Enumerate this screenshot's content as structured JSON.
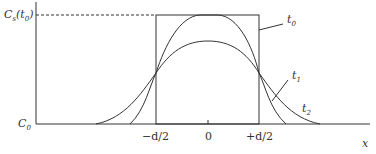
{
  "diagram": {
    "y_label_top": "C_s(t_0)",
    "y_label_bottom": "C_0",
    "x_axis_label": "x",
    "x_ticks": [
      "-d/2",
      "0",
      "+d/2"
    ],
    "curve_labels": [
      "t_0",
      "t_1",
      "t_2"
    ]
  },
  "text": {
    "cs": "C",
    "cs_sub": "s",
    "cs_arg": "(t",
    "cs_arg_sub": "0",
    "cs_close": ")",
    "c0": "C",
    "c0_sub": "0",
    "x": "x",
    "tick_neg": "−d/2",
    "tick_zero": "0",
    "tick_pos": "+d/2",
    "t0": "t",
    "t0_sub": "0",
    "t1": "t",
    "t1_sub": "1",
    "t2": "t",
    "t2_sub": "2"
  }
}
